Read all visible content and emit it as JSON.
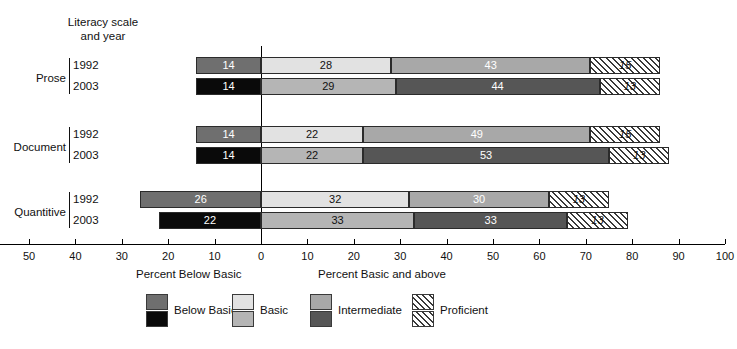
{
  "header": {
    "caption_line1": "Literacy scale",
    "caption_line2": "and year"
  },
  "axis": {
    "left_caption": "Percent Below Basic",
    "right_caption": "Percent Basic and above",
    "tick_labels": [
      "70",
      "60",
      "50",
      "40",
      "30",
      "20",
      "10",
      "0",
      "10",
      "20",
      "30",
      "40",
      "50",
      "60",
      "70",
      "80",
      "90",
      "100"
    ],
    "tick_values": [
      -70,
      -60,
      -50,
      -40,
      -30,
      -20,
      -10,
      0,
      10,
      20,
      30,
      40,
      50,
      60,
      70,
      80,
      90,
      100
    ]
  },
  "legend": {
    "items": [
      {
        "label": "Below Basic",
        "swatch_1992": "#6f6f6f",
        "swatch_2003": "#0a0a0a",
        "hatched": false
      },
      {
        "label": "Basic",
        "swatch_1992": "#e2e2e2",
        "swatch_2003": "#b5b5b5",
        "hatched": false
      },
      {
        "label": "Intermediate",
        "swatch_1992": "#a8a8a8",
        "swatch_2003": "#565656",
        "hatched": false
      },
      {
        "label": "Proficient",
        "swatch_1992": "#ffffff",
        "swatch_2003": "#ffffff",
        "hatched": true
      }
    ]
  },
  "groups": [
    {
      "name": "Prose",
      "years": [
        "1992",
        "2003"
      ]
    },
    {
      "name": "Document",
      "years": [
        "1992",
        "2003"
      ]
    },
    {
      "name": "Quantitive",
      "years": [
        "1992",
        "2003"
      ]
    }
  ],
  "chart_data": {
    "type": "bar",
    "orientation": "horizontal",
    "stacked": true,
    "diverging": true,
    "title": "",
    "xlabel": "",
    "ylabel": "",
    "xlim": [
      -70,
      100
    ],
    "grid": false,
    "legend_position": "bottom",
    "categories": [
      "Prose 1992",
      "Prose 2003",
      "Document 1992",
      "Document 2003",
      "Quantitive 1992",
      "Quantitive 2003"
    ],
    "series": [
      {
        "name": "Below Basic",
        "values": [
          14,
          14,
          14,
          14,
          26,
          22
        ]
      },
      {
        "name": "Basic",
        "values": [
          28,
          29,
          22,
          22,
          32,
          33
        ]
      },
      {
        "name": "Intermediate",
        "values": [
          43,
          44,
          49,
          53,
          30,
          33
        ]
      },
      {
        "name": "Proficient",
        "values": [
          15,
          13,
          15,
          13,
          13,
          13
        ]
      }
    ],
    "rows": [
      {
        "group": "Prose",
        "year": "1992",
        "below_basic": 14,
        "basic": 28,
        "intermediate": 43,
        "proficient": 15
      },
      {
        "group": "Prose",
        "year": "2003",
        "below_basic": 14,
        "basic": 29,
        "intermediate": 44,
        "proficient": 13
      },
      {
        "group": "Document",
        "year": "1992",
        "below_basic": 14,
        "basic": 22,
        "intermediate": 49,
        "proficient": 15
      },
      {
        "group": "Document",
        "year": "2003",
        "below_basic": 14,
        "basic": 22,
        "intermediate": 53,
        "proficient": 13
      },
      {
        "group": "Quantitive",
        "year": "1992",
        "below_basic": 26,
        "basic": 32,
        "intermediate": 30,
        "proficient": 13
      },
      {
        "group": "Quantitive",
        "year": "2003",
        "below_basic": 22,
        "basic": 33,
        "intermediate": 33,
        "proficient": 13
      }
    ]
  }
}
